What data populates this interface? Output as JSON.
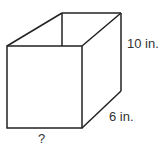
{
  "diagram": {
    "type": "rectangular-prism",
    "labels": {
      "height": "10 in.",
      "depth": "6 in.",
      "width": "?"
    },
    "colors": {
      "stroke": "#222222",
      "text": "#333333",
      "background": "#ffffff"
    }
  }
}
